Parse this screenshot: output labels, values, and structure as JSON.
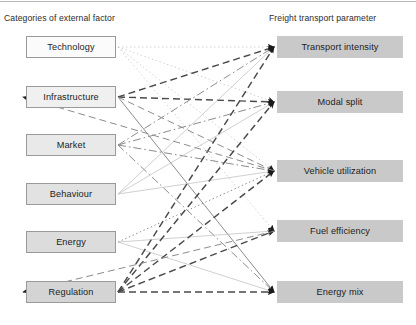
{
  "headers": {
    "left": "Categories of external factor",
    "right": "Freight transport parameter"
  },
  "left_nodes": [
    {
      "id": "technology",
      "label": "Technology",
      "x": 26,
      "y": 36,
      "fill": "fill-0"
    },
    {
      "id": "infrastructure",
      "label": "Infrastructure",
      "x": 26,
      "y": 86,
      "fill": "fill-1"
    },
    {
      "id": "market",
      "label": "Market",
      "x": 26,
      "y": 134,
      "fill": "fill-2"
    },
    {
      "id": "behaviour",
      "label": "Behaviour",
      "x": 26,
      "y": 183,
      "fill": "fill-3"
    },
    {
      "id": "energy",
      "label": "Energy",
      "x": 26,
      "y": 231,
      "fill": "fill-4"
    },
    {
      "id": "regulation",
      "label": "Regulation",
      "x": 26,
      "y": 281,
      "fill": "fill-5"
    }
  ],
  "right_nodes": [
    {
      "id": "transport-intensity",
      "label": "Transport intensity",
      "x": 277,
      "y": 36,
      "fill": "fill-r"
    },
    {
      "id": "modal-split",
      "label": "Modal split",
      "x": 277,
      "y": 91,
      "fill": "fill-r"
    },
    {
      "id": "vehicle-utilization",
      "label": "Vehicle utilization",
      "x": 277,
      "y": 160,
      "fill": "fill-r"
    },
    {
      "id": "fuel-efficiency",
      "label": "Fuel efficiency",
      "x": 277,
      "y": 220,
      "fill": "fill-r"
    },
    {
      "id": "energy-mix",
      "label": "Energy mix",
      "x": 277,
      "y": 281,
      "fill": "fill-r"
    }
  ],
  "colors": {
    "edge_dark": "#4a4a4a",
    "edge_mid": "#8c8c8c",
    "edge_light": "#c0c0c0",
    "arrow": "#1a1a1a",
    "node_border": "#9a9a9a",
    "text": "#1d1d1d"
  },
  "edges": [
    {
      "from": "technology",
      "to": "transport-intensity",
      "style": "dotted",
      "weight": "light"
    },
    {
      "from": "technology",
      "to": "modal-split",
      "style": "dotted",
      "weight": "light"
    },
    {
      "from": "technology",
      "to": "vehicle-utilization",
      "style": "dotted",
      "weight": "light"
    },
    {
      "from": "technology",
      "to": "fuel-efficiency",
      "style": "dotted",
      "weight": "light"
    },
    {
      "from": "infrastructure",
      "to": "transport-intensity",
      "style": "dashed",
      "weight": "dark"
    },
    {
      "from": "infrastructure",
      "to": "modal-split",
      "style": "dashed",
      "weight": "dark"
    },
    {
      "from": "infrastructure",
      "to": "vehicle-utilization",
      "style": "dashed",
      "weight": "mid"
    },
    {
      "from": "infrastructure",
      "to": "energy-mix",
      "style": "solid",
      "weight": "mid"
    },
    {
      "from": "market",
      "to": "transport-intensity",
      "style": "dashdot",
      "weight": "mid"
    },
    {
      "from": "market",
      "to": "modal-split",
      "style": "dashdot",
      "weight": "mid"
    },
    {
      "from": "market",
      "to": "vehicle-utilization",
      "style": "dashdot",
      "weight": "mid"
    },
    {
      "from": "market",
      "to": "energy-mix",
      "style": "dashdot",
      "weight": "mid"
    },
    {
      "from": "behaviour",
      "to": "transport-intensity",
      "style": "solid",
      "weight": "light"
    },
    {
      "from": "behaviour",
      "to": "modal-split",
      "style": "solid",
      "weight": "light"
    },
    {
      "from": "behaviour",
      "to": "vehicle-utilization",
      "style": "solid",
      "weight": "light"
    },
    {
      "from": "energy",
      "to": "vehicle-utilization",
      "style": "dotted",
      "weight": "mid"
    },
    {
      "from": "energy",
      "to": "fuel-efficiency",
      "style": "solid",
      "weight": "light"
    },
    {
      "from": "energy",
      "to": "energy-mix",
      "style": "solid",
      "weight": "light"
    },
    {
      "from": "regulation",
      "to": "transport-intensity",
      "style": "dashed",
      "weight": "dark"
    },
    {
      "from": "regulation",
      "to": "modal-split",
      "style": "dashed",
      "weight": "dark"
    },
    {
      "from": "regulation",
      "to": "vehicle-utilization",
      "style": "dashed",
      "weight": "dark"
    },
    {
      "from": "regulation",
      "to": "fuel-efficiency",
      "style": "dashed",
      "weight": "dark"
    },
    {
      "from": "regulation",
      "to": "energy-mix",
      "style": "dashed",
      "weight": "dark"
    },
    {
      "from": "vehicle-utilization",
      "to": "infrastructure",
      "style": "dashed",
      "weight": "mid"
    },
    {
      "from": "fuel-efficiency",
      "to": "regulation",
      "style": "dashed",
      "weight": "mid"
    }
  ]
}
